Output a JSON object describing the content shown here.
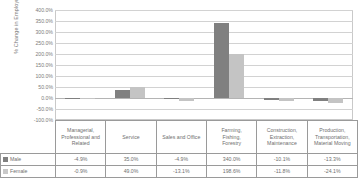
{
  "chart_data": {
    "type": "bar",
    "title": "",
    "xlabel": "",
    "ylabel": "% Change in Employment",
    "ylim": [
      -100,
      400
    ],
    "yticks": [
      "400.0%",
      "350.0%",
      "300.0%",
      "250.0%",
      "200.0%",
      "150.0%",
      "100.0%",
      "50.0%",
      "0.0%",
      "-50.0%",
      "-100.0%"
    ],
    "ytick_values": [
      400,
      350,
      300,
      250,
      200,
      150,
      100,
      50,
      0,
      -50,
      -100
    ],
    "grid": true,
    "legend_position": "table-left",
    "categories": [
      "Managerial, Professional and Related",
      "Service",
      "Sales and Office",
      "Farming, Fishing, Forestry",
      "Construction, Extraction, Maintenance",
      "Production, Transportation, Material Moving"
    ],
    "series": [
      {
        "name": "Male",
        "color": "#808080",
        "values": [
          -4.9,
          35.0,
          -4.9,
          340.0,
          -10.1,
          -13.3
        ],
        "labels": [
          "-4.9%",
          "35.0%",
          "-4.9%",
          "340.0%",
          "-10.1%",
          "-13.3%"
        ]
      },
      {
        "name": "Female",
        "color": "#c4c4c4",
        "values": [
          -0.9,
          49.0,
          -13.1,
          198.6,
          -11.8,
          -24.1
        ],
        "labels": [
          "-0.9%",
          "49.0%",
          "-13.1%",
          "198.6%",
          "-11.8%",
          "-24.1%"
        ]
      }
    ]
  },
  "legend": {
    "male_label": "Male",
    "female_label": "Female"
  }
}
